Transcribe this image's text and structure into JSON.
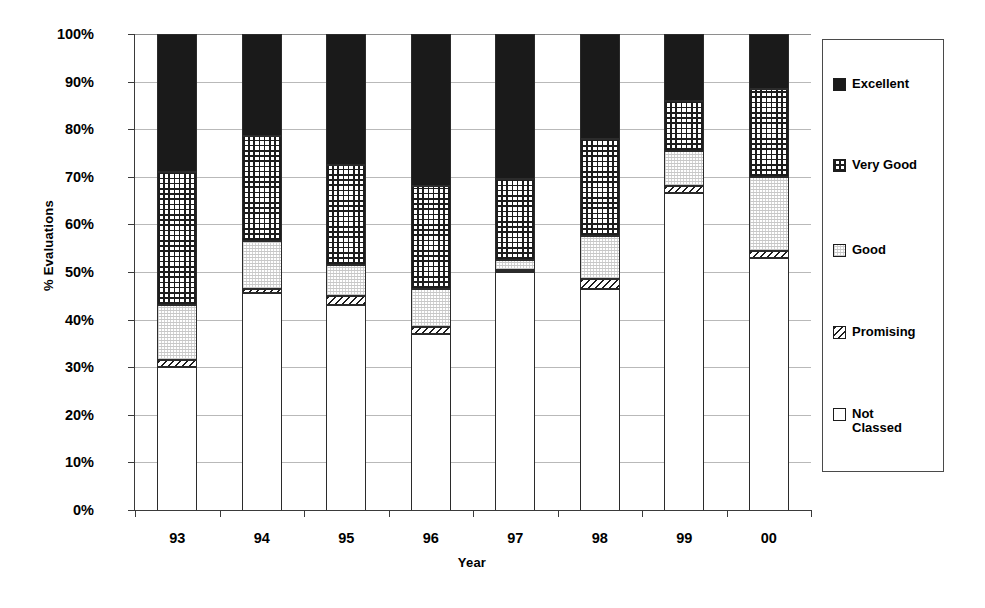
{
  "chart_data": {
    "type": "bar",
    "subtype": "stacked-100-percent",
    "title": "",
    "xlabel": "Year",
    "ylabel": "% Evaluations",
    "categories": [
      "93",
      "94",
      "95",
      "96",
      "97",
      "98",
      "99",
      "00"
    ],
    "ylim": [
      0,
      100
    ],
    "ytick_labels": [
      "0%",
      "10%",
      "20%",
      "30%",
      "40%",
      "50%",
      "60%",
      "70%",
      "80%",
      "90%",
      "100%"
    ],
    "ytick_values": [
      0,
      10,
      20,
      30,
      40,
      50,
      60,
      70,
      80,
      90,
      100
    ],
    "grid": true,
    "legend_position": "right",
    "stack_order_bottom_to_top": [
      "Not Classed",
      "Promising",
      "Good",
      "Very Good",
      "Excellent"
    ],
    "series": [
      {
        "name": "Not Classed",
        "fill": "notclassed",
        "color": "#ffffff",
        "values": [
          30.0,
          45.5,
          43.0,
          37.0,
          50.0,
          46.5,
          66.5,
          53.0
        ]
      },
      {
        "name": "Promising",
        "fill": "promising",
        "color": "#ffffff",
        "values": [
          1.5,
          1.0,
          2.0,
          1.5,
          0.5,
          2.0,
          1.5,
          1.5
        ]
      },
      {
        "name": "Good",
        "fill": "good",
        "color": "#e8e8e8",
        "values": [
          11.5,
          10.0,
          6.5,
          8.0,
          2.0,
          9.0,
          7.5,
          15.5
        ]
      },
      {
        "name": "Very Good",
        "fill": "verygood",
        "color": "#ffffff",
        "values": [
          28.0,
          22.0,
          21.0,
          21.5,
          17.0,
          20.5,
          10.5,
          18.5
        ]
      },
      {
        "name": "Excellent",
        "fill": "excellent",
        "color": "#1a1a1a",
        "values": [
          29.0,
          21.5,
          27.5,
          32.0,
          30.5,
          22.0,
          14.0,
          11.5
        ]
      }
    ],
    "cumulative_tops": {
      "93": [
        30.0,
        31.5,
        43.0,
        71.0,
        100.0
      ],
      "94": [
        45.5,
        46.5,
        56.5,
        78.5,
        100.0
      ],
      "95": [
        43.0,
        45.0,
        51.5,
        72.5,
        100.0
      ],
      "96": [
        37.0,
        38.5,
        46.5,
        68.0,
        100.0
      ],
      "97": [
        50.0,
        50.5,
        52.5,
        69.5,
        100.0
      ],
      "98": [
        46.5,
        48.5,
        57.5,
        78.0,
        100.0
      ],
      "99": [
        66.5,
        68.0,
        75.5,
        86.0,
        100.0
      ],
      "00": [
        53.0,
        54.5,
        70.0,
        88.5,
        100.0
      ]
    }
  },
  "legend": {
    "items": [
      {
        "label": "Excellent",
        "fill": "excellent",
        "top": 37
      },
      {
        "label": "Very Good",
        "fill": "verygood",
        "top": 118
      },
      {
        "label": "Good",
        "fill": "good",
        "top": 203
      },
      {
        "label": "Promising",
        "fill": "promising",
        "top": 285
      },
      {
        "label": "Not\nClassed",
        "fill": "notclassed",
        "top": 367
      }
    ]
  },
  "axes": {
    "y_title": "% Evaluations",
    "x_title": "Year"
  }
}
